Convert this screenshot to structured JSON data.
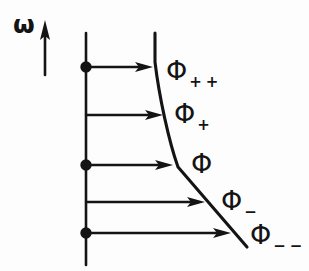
{
  "figure": {
    "kind": "velocity-profile-diagram",
    "axis_label": "ω",
    "curve_labels": [
      {
        "base": "Φ",
        "sub": "++"
      },
      {
        "base": "Φ",
        "sub": "+"
      },
      {
        "base": "Φ",
        "sub": ""
      },
      {
        "base": "Φ",
        "sub": "−"
      },
      {
        "base": "Φ",
        "sub": "−−"
      }
    ],
    "colors": {
      "ink": "#141414",
      "background": "#fdfdfd"
    }
  }
}
